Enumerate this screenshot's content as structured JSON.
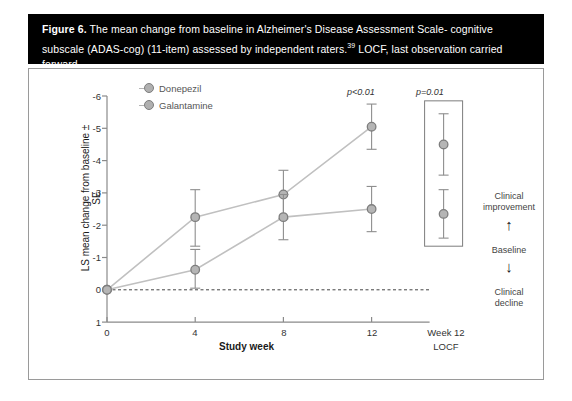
{
  "caption": {
    "figure_number": "Figure 6.",
    "text_part1": " The mean change from baseline in Alzheimer's Disease Assessment Scale- cognitive subscale (ADAS-cog) (11-item) assessed by independent raters.",
    "reference": "39",
    "text_part2": " LOCF, last observation carried forward."
  },
  "chart_data": {
    "type": "line",
    "title": "",
    "xlabel": "Study week",
    "ylabel": "LS mean change from baseline ± SE",
    "x": [
      0,
      4,
      8,
      12
    ],
    "xtick_labels": [
      "0",
      "4",
      "8",
      "12"
    ],
    "extra_xtick_label_line1": "Week 12",
    "extra_xtick_label_line2": "LOCF",
    "ytick_labels": [
      "-6",
      "-5",
      "-4",
      "-3",
      "-2",
      "-1",
      "0",
      "1"
    ],
    "ylim": [
      1,
      -6
    ],
    "y_inverted": true,
    "grid": false,
    "legend_position": "top-left",
    "series": [
      {
        "name": "Donepezil",
        "color": "#b0b0b0",
        "values": [
          0,
          -2.25,
          -2.95,
          -5.05
        ],
        "err_low": [
          0,
          -1.35,
          -2.2,
          -4.35
        ],
        "err_high": [
          0,
          -3.1,
          -3.7,
          -5.75
        ],
        "locf_value": -4.5,
        "locf_err_low": -3.55,
        "locf_err_high": -5.45
      },
      {
        "name": "Galantamine",
        "color": "#b0b0b0",
        "values": [
          0,
          -0.62,
          -2.25,
          -2.5
        ],
        "err_low": [
          0,
          -0.05,
          -1.55,
          -1.8
        ],
        "err_high": [
          0,
          -1.25,
          -2.95,
          -3.2
        ],
        "locf_value": -2.35,
        "locf_err_low": -1.6,
        "locf_err_high": -3.1
      }
    ],
    "annotations": [
      {
        "text": "p<0.01",
        "at_x": 12,
        "note": "donepezil week 12 significance"
      },
      {
        "text": "p=0.01",
        "at_x": "Week 12 LOCF",
        "note": "LOCF significance"
      }
    ],
    "side_annotations": {
      "improvement": "Clinical\nimprovement",
      "baseline": "Baseline",
      "decline": "Clinical\ndecline",
      "up_arrow": "↑",
      "down_arrow": "↓"
    },
    "baseline_line_value": 0
  },
  "colors": {
    "banner_bg": "#000000",
    "banner_text": "#ffffff",
    "panel_border": "#9a9a9a",
    "series_line": "#c0c0c0",
    "marker_fill": "#b5b5b5",
    "marker_stroke": "#7d7d7d",
    "axis": "#8a8a8a"
  }
}
